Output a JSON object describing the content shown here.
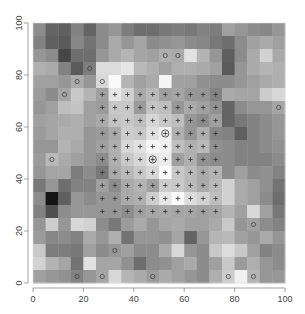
{
  "chart_data": {
    "type": "heatmap",
    "title": "",
    "xlabel": "",
    "ylabel": "",
    "xlim": [
      0,
      100
    ],
    "ylim": [
      0,
      100
    ],
    "x_ticks": [
      "0",
      "20",
      "40",
      "60",
      "80",
      "100"
    ],
    "y_ticks": [
      "0",
      "20",
      "40",
      "60",
      "80",
      "100"
    ],
    "grid_cells": [
      20,
      20
    ],
    "cell_size": 5,
    "colormap": "grayscale",
    "gray_rows_top_to_bottom": [
      [
        140,
        100,
        95,
        130,
        100,
        140,
        150,
        125,
        110,
        110,
        120,
        125,
        120,
        130,
        125,
        160,
        150,
        140,
        135,
        150
      ],
      [
        130,
        95,
        90,
        135,
        115,
        140,
        170,
        150,
        165,
        140,
        145,
        150,
        140,
        135,
        120,
        110,
        140,
        160,
        170,
        160
      ],
      [
        150,
        140,
        70,
        110,
        110,
        150,
        170,
        180,
        165,
        160,
        175,
        170,
        225,
        180,
        150,
        95,
        140,
        170,
        210,
        170
      ],
      [
        175,
        170,
        130,
        90,
        125,
        220,
        220,
        230,
        185,
        175,
        160,
        175,
        175,
        170,
        160,
        90,
        150,
        170,
        180,
        175
      ],
      [
        160,
        160,
        150,
        170,
        150,
        215,
        250,
        180,
        160,
        170,
        245,
        160,
        160,
        145,
        140,
        140,
        150,
        160,
        170,
        175
      ],
      [
        155,
        140,
        165,
        200,
        180,
        160,
        230,
        210,
        170,
        185,
        160,
        165,
        150,
        150,
        130,
        170,
        165,
        165,
        205,
        215
      ],
      [
        150,
        160,
        190,
        195,
        160,
        155,
        200,
        200,
        155,
        195,
        190,
        150,
        170,
        160,
        145,
        100,
        140,
        150,
        150,
        165
      ],
      [
        160,
        165,
        170,
        175,
        160,
        170,
        195,
        200,
        190,
        215,
        200,
        190,
        150,
        140,
        160,
        100,
        120,
        130,
        140,
        150
      ],
      [
        155,
        165,
        175,
        175,
        150,
        155,
        170,
        205,
        200,
        225,
        240,
        175,
        150,
        175,
        135,
        130,
        95,
        130,
        140,
        150
      ],
      [
        150,
        150,
        180,
        170,
        150,
        160,
        175,
        215,
        225,
        245,
        240,
        190,
        175,
        185,
        145,
        140,
        130,
        130,
        140,
        145
      ],
      [
        155,
        185,
        170,
        160,
        150,
        140,
        175,
        200,
        215,
        230,
        235,
        160,
        175,
        145,
        140,
        140,
        130,
        130,
        130,
        140
      ],
      [
        150,
        165,
        165,
        125,
        140,
        120,
        170,
        185,
        200,
        215,
        250,
        200,
        185,
        170,
        180,
        140,
        160,
        140,
        145,
        130
      ],
      [
        120,
        150,
        110,
        130,
        130,
        160,
        140,
        170,
        180,
        160,
        205,
        200,
        185,
        170,
        185,
        210,
        170,
        160,
        145,
        115
      ],
      [
        140,
        20,
        95,
        150,
        140,
        150,
        150,
        170,
        175,
        205,
        230,
        250,
        220,
        210,
        190,
        210,
        170,
        160,
        140,
        110
      ],
      [
        130,
        80,
        140,
        150,
        150,
        150,
        150,
        140,
        160,
        165,
        170,
        165,
        165,
        160,
        165,
        180,
        160,
        215,
        160,
        120
      ],
      [
        150,
        205,
        150,
        215,
        210,
        140,
        120,
        155,
        170,
        150,
        165,
        170,
        160,
        160,
        170,
        200,
        150,
        160,
        140,
        130
      ],
      [
        155,
        135,
        140,
        130,
        170,
        150,
        175,
        115,
        150,
        150,
        145,
        165,
        100,
        150,
        180,
        185,
        160,
        150,
        170,
        150
      ],
      [
        200,
        125,
        125,
        120,
        160,
        140,
        150,
        160,
        140,
        140,
        170,
        215,
        150,
        140,
        200,
        220,
        200,
        160,
        130,
        140
      ],
      [
        210,
        180,
        165,
        115,
        225,
        165,
        165,
        145,
        110,
        140,
        145,
        160,
        170,
        140,
        160,
        200,
        155,
        175,
        150,
        140
      ],
      [
        160,
        150,
        145,
        130,
        150,
        165,
        215,
        180,
        170,
        155,
        170,
        160,
        150,
        140,
        175,
        205,
        240,
        180,
        150,
        150
      ]
    ],
    "overlays": {
      "plus_markers": {
        "x_range": [
          27.5,
          72.5
        ],
        "y_range": [
          27.5,
          72.5
        ],
        "step": 5,
        "count": 100
      },
      "circled_plus": [
        [
          52.5,
          57.5
        ],
        [
          47.5,
          47.5
        ]
      ],
      "open_circles": [
        [
          52.5,
          87.5
        ],
        [
          57.5,
          87.5
        ],
        [
          22.5,
          82.5
        ],
        [
          17.5,
          77.5
        ],
        [
          27.5,
          77.5
        ],
        [
          12.5,
          72.5
        ],
        [
          97.5,
          67.5
        ],
        [
          7.5,
          47.5
        ],
        [
          87.5,
          22.5
        ],
        [
          32.5,
          12.5
        ],
        [
          17.5,
          2.5
        ],
        [
          27.5,
          2.5
        ],
        [
          47.5,
          2.5
        ],
        [
          77.5,
          2.5
        ],
        [
          87.5,
          2.5
        ]
      ]
    },
    "grid": false,
    "legend": null
  }
}
